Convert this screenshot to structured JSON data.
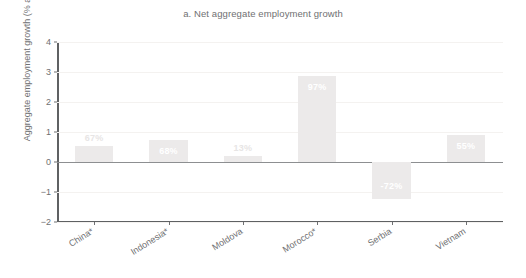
{
  "chart_data": {
    "type": "bar",
    "title": "a. Net aggregate employment growth",
    "xlabel": "",
    "ylabel": "Aggregate employment growth (% annual)",
    "categories": [
      "China*",
      "Indonesia*",
      "Moldova",
      "Morocco*",
      "Serbia",
      "Vietnam"
    ],
    "values": [
      0.52,
      0.75,
      0.2,
      2.88,
      -1.22,
      0.9
    ],
    "data_labels": [
      "67%",
      "68%",
      "13%",
      "97%",
      "-72%",
      "55%"
    ],
    "ylim": [
      -2,
      4
    ],
    "yticks": [
      4,
      3,
      2,
      1,
      0,
      -1,
      -2
    ],
    "ytick_labels": [
      "4",
      "3",
      "2",
      "1",
      "0",
      "−1",
      "−2"
    ],
    "grid": true,
    "legend": null,
    "bar_color": "#eceaea",
    "label_color": "#ffffff",
    "axis_color": "#6f7072"
  },
  "figure": {
    "background": "#ffffff"
  }
}
